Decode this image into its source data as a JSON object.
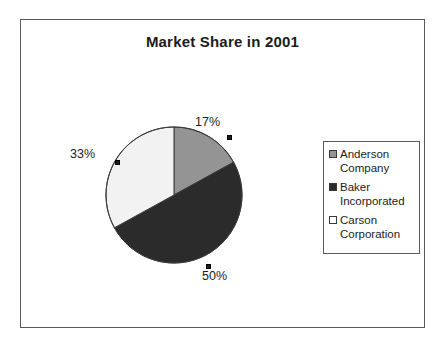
{
  "chart_data": {
    "type": "pie",
    "title": "Market Share in 2001",
    "categories": [
      "Anderson Company",
      "Baker Incorporated",
      "Carson Corporation"
    ],
    "values": [
      17,
      50,
      33
    ],
    "value_labels": [
      "17%",
      "50%",
      "33%"
    ],
    "units": "percent",
    "legend_position": "right",
    "grid": false,
    "start_angle_deg": 0,
    "direction": "clockwise",
    "colors": [
      "#949494",
      "#2b2b2b",
      "#f2f2f2"
    ],
    "slice_outline_color": "#3a3a3a",
    "frame_border_color": "#5a5a5a",
    "background": "#ffffff",
    "text_color": "#1c1c1c"
  },
  "title": {
    "text": "Market Share in 2001"
  },
  "labels": {
    "anderson": "17%",
    "baker": "50%",
    "carson": "33%"
  },
  "legend": {
    "items": [
      {
        "label": "Anderson Company",
        "swatch": "#949494"
      },
      {
        "label": "Baker Incorporated",
        "swatch": "#2b2b2b"
      },
      {
        "label": "Carson Corporation",
        "swatch": "#ffffff"
      }
    ]
  }
}
